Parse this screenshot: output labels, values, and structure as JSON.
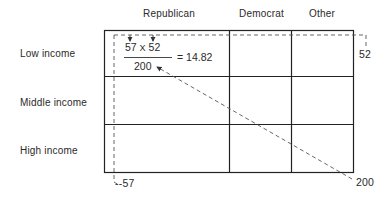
{
  "table": {
    "columns": [
      "Republican",
      "Democrat",
      "Other"
    ],
    "rows": [
      "Low income",
      "Middle income",
      "High income"
    ]
  },
  "formula": {
    "row_total": "57",
    "multiply_sign": "X",
    "column_total": "52",
    "grand_total": "200",
    "equals": "= 14.82"
  },
  "annotations": {
    "column_total_label": "52",
    "row_total_label": "--57",
    "grand_total_label": "200"
  },
  "colors": {
    "line": "#222222",
    "dashed": "#555555",
    "text": "#2a2a2a"
  }
}
